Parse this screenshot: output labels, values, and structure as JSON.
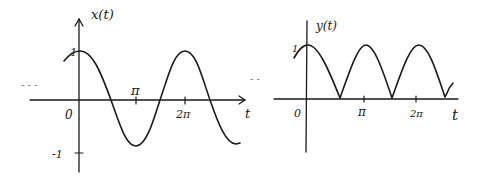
{
  "colors": {
    "ink": "#1a1a1a",
    "background": "#ffffff"
  },
  "left_plot": {
    "y_label": "x(t)",
    "x_label": "t",
    "y_tick_top": "1",
    "y_tick_bottom": "-1",
    "origin": "0",
    "x_tick_pi": "π",
    "x_tick_2pi": "2π",
    "ellipsis": "- - -",
    "description": "cosine wave x(t) = cos(t), amplitude 1, period 2π"
  },
  "right_plot": {
    "y_label": "y(t)",
    "x_label": "t",
    "y_tick_top": "1",
    "origin": "0",
    "x_tick_pi": "π",
    "x_tick_2pi": "2π",
    "ellipsis": "- -",
    "description": "full-wave rectified cosine y(t) = |cos(t)|, amplitude 1, period π"
  }
}
